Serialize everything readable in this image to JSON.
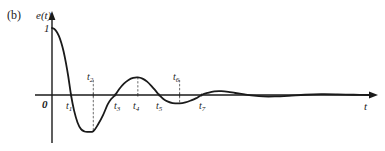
{
  "figure": {
    "panel_label": "(b)",
    "y_axis_label": "e(t)",
    "x_axis_label": "t",
    "origin_label": "0",
    "unit_label": "1"
  },
  "tick_labels": [
    {
      "name": "t1",
      "base": "t",
      "sub": "1",
      "x": 66,
      "y": 101,
      "side": "below"
    },
    {
      "name": "t2",
      "base": "t",
      "sub": "2",
      "x": 87,
      "y": 72,
      "side": "above"
    },
    {
      "name": "t3",
      "base": "t",
      "sub": "3",
      "x": 114,
      "y": 101,
      "side": "below"
    },
    {
      "name": "t4",
      "base": "t",
      "sub": "4",
      "x": 133,
      "y": 101,
      "side": "below"
    },
    {
      "name": "t5",
      "base": "t",
      "sub": "5",
      "x": 156,
      "y": 101,
      "side": "below"
    },
    {
      "name": "t6",
      "base": "t",
      "sub": "6",
      "x": 173,
      "y": 72,
      "side": "above"
    },
    {
      "name": "t7",
      "base": "t",
      "sub": "7",
      "x": 199,
      "y": 101,
      "side": "below"
    }
  ],
  "chart_data": {
    "type": "line",
    "title": "(b)",
    "xlabel": "t",
    "ylabel": "e(t)",
    "grid": false,
    "legend": false,
    "xlim": [
      0,
      14
    ],
    "ylim": [
      -0.62,
      1.05
    ],
    "axis_origin_px": {
      "x": 52,
      "y": 95
    },
    "x_scale_px_per_unit": 23.2,
    "y_scale_px_per_unit": 67,
    "marked_points": [
      {
        "label": "t1",
        "t": 0.82,
        "e": 0.0,
        "kind": "zero-crossing"
      },
      {
        "label": "t2",
        "t": 1.78,
        "e": -0.54,
        "kind": "minimum"
      },
      {
        "label": "t3",
        "t": 2.72,
        "e": 0.0,
        "kind": "zero-crossing"
      },
      {
        "label": "t4",
        "t": 3.7,
        "e": 0.26,
        "kind": "maximum"
      },
      {
        "label": "t5",
        "t": 4.62,
        "e": 0.0,
        "kind": "zero-crossing"
      },
      {
        "label": "t6",
        "t": 5.5,
        "e": -0.12,
        "kind": "minimum"
      },
      {
        "label": "t7",
        "t": 6.45,
        "e": 0.0,
        "kind": "zero-crossing"
      }
    ],
    "series": [
      {
        "name": "e(t)",
        "color": "#1a1a1a",
        "x": [
          0.0,
          0.1,
          0.2,
          0.3,
          0.4,
          0.5,
          0.6,
          0.7,
          0.82,
          0.95,
          1.1,
          1.25,
          1.4,
          1.55,
          1.78,
          2.0,
          2.2,
          2.4,
          2.55,
          2.72,
          2.9,
          3.1,
          3.3,
          3.5,
          3.7,
          3.9,
          4.1,
          4.3,
          4.46,
          4.62,
          4.8,
          5.0,
          5.2,
          5.5,
          5.75,
          6.0,
          6.2,
          6.45,
          6.7,
          7.0,
          7.3,
          7.6,
          7.9,
          8.3,
          8.7,
          9.1,
          9.6,
          10.2,
          10.9,
          11.6,
          12.3,
          13.0,
          13.7
        ],
        "y": [
          1.0,
          0.985,
          0.945,
          0.88,
          0.78,
          0.65,
          0.48,
          0.28,
          0.0,
          -0.23,
          -0.41,
          -0.51,
          -0.545,
          -0.55,
          -0.54,
          -0.43,
          -0.3,
          -0.14,
          -0.06,
          0.0,
          0.09,
          0.17,
          0.225,
          0.255,
          0.262,
          0.245,
          0.2,
          0.13,
          0.065,
          0.0,
          -0.06,
          -0.1,
          -0.12,
          -0.125,
          -0.11,
          -0.08,
          -0.05,
          0.0,
          0.03,
          0.055,
          0.058,
          0.048,
          0.03,
          0.01,
          -0.01,
          -0.022,
          -0.022,
          -0.012,
          0.004,
          0.012,
          0.01,
          0.004,
          0.0
        ]
      }
    ],
    "dotted_drop_lines": [
      {
        "label": "t2",
        "t": 1.78,
        "from_e": 0.22,
        "to_e": -0.54
      },
      {
        "label": "t4",
        "t": 3.7,
        "from_e": 0.262,
        "to_e": 0.0
      },
      {
        "label": "t6",
        "t": 5.5,
        "from_e": 0.22,
        "to_e": -0.125
      }
    ]
  }
}
